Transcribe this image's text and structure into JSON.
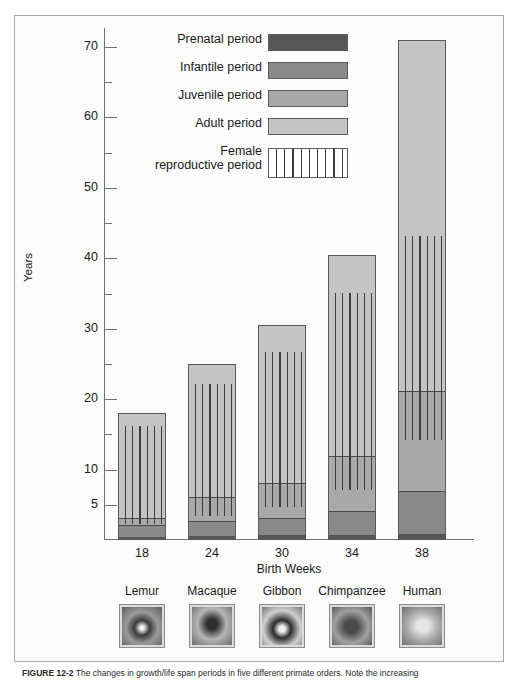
{
  "figure": {
    "caption_number": "FIGURE 12-2",
    "caption_text": "The changes in growth/life span periods in five different primate orders. Note the increasing"
  },
  "chart_data": {
    "type": "bar",
    "stacked": true,
    "title": "",
    "xlabel": "Birth Weeks",
    "ylabel": "Years",
    "categories": [
      "18",
      "24",
      "30",
      "34",
      "38"
    ],
    "category_names": [
      "Lemur",
      "Macaque",
      "Gibbon",
      "Chimpanzee",
      "Human"
    ],
    "ylim": [
      0,
      73
    ],
    "yticks_major": [
      5,
      10,
      20,
      30,
      40,
      50,
      60,
      70
    ],
    "yticks_minor": [
      15,
      25,
      35,
      45,
      55,
      65
    ],
    "grid": false,
    "legend_position": "top-left-inside",
    "series": [
      {
        "name": "Prenatal period",
        "color": "#565656",
        "values": [
          0.35,
          0.45,
          0.55,
          0.62,
          0.73
        ]
      },
      {
        "name": "Infantile period",
        "color": "#8a8a8a",
        "values": [
          1.7,
          2.1,
          2.4,
          3.3,
          6.1
        ]
      },
      {
        "name": "Juvenile period",
        "color": "#a9a9a9",
        "values": [
          1.0,
          3.4,
          5.0,
          7.9,
          14.2
        ]
      },
      {
        "name": "Adult period",
        "color": "#c4c4c4",
        "values": [
          15.0,
          19.0,
          22.5,
          28.7,
          50.0
        ]
      }
    ],
    "totals": [
      18.0,
      25.0,
      30.5,
      40.5,
      71.0
    ],
    "female_reproductive_period": {
      "name": "Female reproductive period",
      "hatch": "vertical-lines",
      "ranges": [
        {
          "category": "18",
          "start": 2.2,
          "end": 16.0
        },
        {
          "category": "24",
          "start": 3.2,
          "end": 22.0
        },
        {
          "category": "30",
          "start": 4.5,
          "end": 26.5
        },
        {
          "category": "34",
          "start": 7.0,
          "end": 35.0
        },
        {
          "category": "38",
          "start": 14.0,
          "end": 43.0
        }
      ]
    }
  },
  "legend": {
    "items": [
      {
        "label": "Prenatal period",
        "swatch": "prenatal"
      },
      {
        "label": "Infantile period",
        "swatch": "infantile"
      },
      {
        "label": "Juvenile period",
        "swatch": "juvenile"
      },
      {
        "label": "Adult period",
        "swatch": "adult"
      },
      {
        "label": "Female\nreproductive period",
        "swatch": "female"
      }
    ]
  },
  "axes": {
    "y_title": "Years",
    "x_title": "Birth Weeks",
    "y_labels": [
      "70",
      "60",
      "50",
      "40",
      "30",
      "20",
      "10",
      "5"
    ],
    "x_labels": [
      "18",
      "24",
      "30",
      "34",
      "38"
    ]
  },
  "species": [
    {
      "name": "Lemur",
      "photo": "lemur-photo"
    },
    {
      "name": "Macaque",
      "photo": "macaque-photo"
    },
    {
      "name": "Gibbon",
      "photo": "gibbon-photo"
    },
    {
      "name": "Chimpanzee",
      "photo": "chimpanzee-photo"
    },
    {
      "name": "Human",
      "photo": "human-photo"
    }
  ]
}
